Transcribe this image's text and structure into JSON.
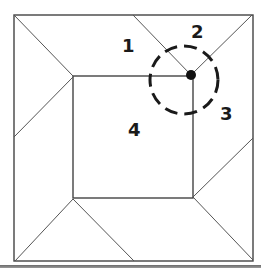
{
  "diagram": {
    "type": "geometry-puzzle",
    "outer_square": {
      "x1": 14,
      "y1": 15,
      "x2": 253,
      "y2": 261
    },
    "inner_square": {
      "x1": 73,
      "y1": 76,
      "x2": 193,
      "y2": 198
    },
    "marked_point": {
      "x": 191,
      "y": 75
    },
    "dashed_circle": {
      "cx": 184,
      "cy": 80,
      "r": 34
    },
    "region_labels": [
      {
        "text": "1",
        "x": 127,
        "y": 52
      },
      {
        "text": "2",
        "x": 197,
        "y": 38
      },
      {
        "text": "3",
        "x": 223,
        "y": 120
      },
      {
        "text": "4",
        "x": 133,
        "y": 136
      }
    ],
    "colors": {
      "line": "#444444",
      "label": "#1a1a1a",
      "dot": "#111111",
      "background": "#ffffff"
    }
  }
}
